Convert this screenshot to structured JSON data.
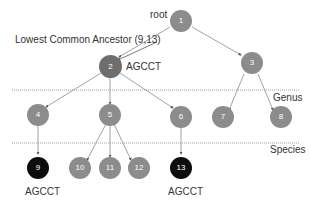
{
  "colors": {
    "node_fill": "#8c8c8c",
    "highlight_fill": "#6e6e6e",
    "leaf_fill": "#0d0d0d",
    "edge": "#8a8a8a",
    "level_line": "#a0a0a0",
    "text": "#333333"
  },
  "labels": {
    "root": "root",
    "lca": "Lowest Common Ancestor (9,13)",
    "lca_seq": "AGCCT",
    "genus": "Genus",
    "species": "Species",
    "seq_9": "AGCCT",
    "seq_13": "AGCCT"
  },
  "nodes": [
    {
      "id": "1",
      "label": "1"
    },
    {
      "id": "2",
      "label": "2"
    },
    {
      "id": "3",
      "label": "3"
    },
    {
      "id": "4",
      "label": "4"
    },
    {
      "id": "5",
      "label": "5"
    },
    {
      "id": "6",
      "label": "6"
    },
    {
      "id": "7",
      "label": "7"
    },
    {
      "id": "8",
      "label": "8"
    },
    {
      "id": "9",
      "label": "9"
    },
    {
      "id": "10",
      "label": "10"
    },
    {
      "id": "11",
      "label": "11"
    },
    {
      "id": "12",
      "label": "12"
    },
    {
      "id": "13",
      "label": "13"
    }
  ],
  "edges": [
    [
      "1",
      "2"
    ],
    [
      "1",
      "3"
    ],
    [
      "2",
      "4"
    ],
    [
      "2",
      "5"
    ],
    [
      "2",
      "6"
    ],
    [
      "3",
      "7"
    ],
    [
      "3",
      "8"
    ],
    [
      "4",
      "9"
    ],
    [
      "5",
      "10"
    ],
    [
      "5",
      "11"
    ],
    [
      "5",
      "12"
    ],
    [
      "6",
      "13"
    ]
  ]
}
